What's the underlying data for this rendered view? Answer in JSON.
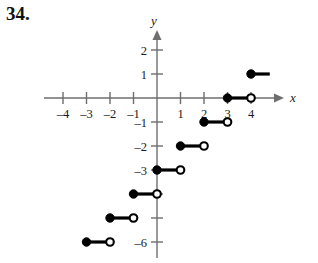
{
  "problem": {
    "number": "34."
  },
  "chart_data": {
    "type": "line",
    "title": "",
    "subtitle": "",
    "xlabel": "x",
    "ylabel": "y",
    "xlim": [
      -4.8,
      5.0
    ],
    "ylim": [
      -6.6,
      2.6
    ],
    "grid": false,
    "legend": null,
    "x_ticks": [
      -4,
      -3,
      -2,
      -1,
      1,
      2,
      3,
      4
    ],
    "x_tick_labels": [
      "-4",
      "-3",
      "-2",
      "-1",
      "1",
      "2",
      "3",
      "4"
    ],
    "y_ticks": [
      2,
      1,
      -1,
      -2,
      -3,
      -4,
      -5,
      -6
    ],
    "y_tick_labels": [
      "2",
      "1",
      "-1",
      "-2",
      "-3",
      "",
      "",
      "-6"
    ],
    "segments": [
      {
        "name": "step-y-6",
        "x_start": -3,
        "x_end": -2,
        "y": -6,
        "left_endpoint": "closed",
        "right_endpoint": "open"
      },
      {
        "name": "step-y-5",
        "x_start": -2,
        "x_end": -1,
        "y": -5,
        "left_endpoint": "closed",
        "right_endpoint": "open"
      },
      {
        "name": "step-y-4",
        "x_start": -1,
        "x_end": 0,
        "y": -4,
        "left_endpoint": "closed",
        "right_endpoint": "open"
      },
      {
        "name": "step-y-3",
        "x_start": 0,
        "x_end": 1,
        "y": -3,
        "left_endpoint": "closed",
        "right_endpoint": "open"
      },
      {
        "name": "step-y-2",
        "x_start": 1,
        "x_end": 2,
        "y": -2,
        "left_endpoint": "closed",
        "right_endpoint": "open"
      },
      {
        "name": "step-y-1",
        "x_start": 2,
        "x_end": 3,
        "y": -1,
        "left_endpoint": "closed",
        "right_endpoint": "open"
      },
      {
        "name": "step-y0",
        "x_start": 3,
        "x_end": 4,
        "y": 0,
        "left_endpoint": "closed",
        "right_endpoint": "open"
      },
      {
        "name": "step-y1",
        "x_start": 4,
        "x_end": 4.8,
        "y": 1,
        "left_endpoint": "closed",
        "right_endpoint": "none"
      }
    ],
    "colors": {
      "curve": "#000000",
      "axis": "#6e6e6e",
      "background": "#ffffff"
    }
  }
}
